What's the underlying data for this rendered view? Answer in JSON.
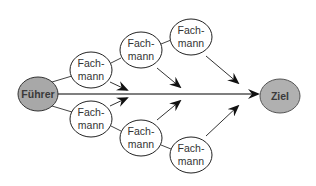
{
  "diagram": {
    "type": "flow-network",
    "colors": {
      "leader_fill": "#a8a8a8",
      "goal_fill": "#b0b0b0",
      "expert_fill": "#ffffff",
      "stroke": "#222222",
      "line": "#555555"
    },
    "leader": {
      "label": "Führer"
    },
    "goal": {
      "label": "Ziel"
    },
    "experts": [
      {
        "id": "upper-1",
        "line1": "Fach-",
        "line2": "mann"
      },
      {
        "id": "upper-2",
        "line1": "Fach-",
        "line2": "mann"
      },
      {
        "id": "upper-3",
        "line1": "Fach-",
        "line2": "mann"
      },
      {
        "id": "lower-1",
        "line1": "Fach-",
        "line2": "mann"
      },
      {
        "id": "lower-2",
        "line1": "Fach-",
        "line2": "mann"
      },
      {
        "id": "lower-3",
        "line1": "Fach-",
        "line2": "mann"
      }
    ],
    "edges": [
      {
        "from": "Führer",
        "to": "Ziel",
        "kind": "main-arrow"
      },
      {
        "from": "Führer",
        "to": "upper-1",
        "kind": "link"
      },
      {
        "from": "upper-1",
        "to": "upper-2",
        "kind": "link"
      },
      {
        "from": "upper-2",
        "to": "upper-3",
        "kind": "link"
      },
      {
        "from": "Führer",
        "to": "lower-1",
        "kind": "link"
      },
      {
        "from": "lower-1",
        "to": "lower-2",
        "kind": "link"
      },
      {
        "from": "lower-2",
        "to": "lower-3",
        "kind": "link"
      },
      {
        "from": "upper-1",
        "to": "main-line",
        "kind": "arrow"
      },
      {
        "from": "upper-2",
        "to": "main-line",
        "kind": "arrow"
      },
      {
        "from": "upper-3",
        "to": "main-line",
        "kind": "arrow"
      },
      {
        "from": "lower-1",
        "to": "main-line",
        "kind": "arrow"
      },
      {
        "from": "lower-2",
        "to": "main-line",
        "kind": "arrow"
      },
      {
        "from": "lower-3",
        "to": "main-line",
        "kind": "arrow"
      }
    ]
  }
}
